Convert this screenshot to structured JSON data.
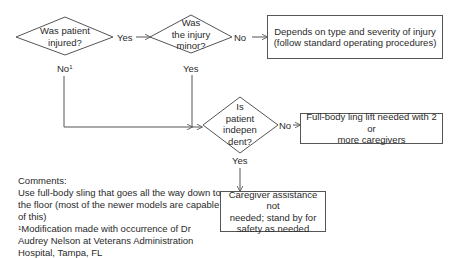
{
  "diagram": {
    "type": "flowchart",
    "decisions": [
      {
        "id": "d1",
        "lines": [
          "Was patient",
          "injured?"
        ]
      },
      {
        "id": "d2",
        "lines": [
          "Was",
          "the injury",
          "minor?"
        ]
      },
      {
        "id": "d3",
        "lines": [
          "Is",
          "patient",
          "indepen",
          "dent?"
        ]
      }
    ],
    "outcomes": [
      {
        "id": "o1",
        "lines": [
          "Depends on type and severity of injury",
          "(follow standard operating procedures)"
        ]
      },
      {
        "id": "o2",
        "lines": [
          "Full-body ling lift needed with 2 or",
          "more caregivers"
        ]
      },
      {
        "id": "o3",
        "lines": [
          "Caregiver assistance not",
          "needed; stand by for",
          "safety as needed"
        ]
      }
    ],
    "edges": [
      {
        "from": "d1",
        "to": "d2",
        "label": "Yes"
      },
      {
        "from": "d2",
        "to": "o1",
        "label": "No"
      },
      {
        "from": "d1",
        "to": "d3",
        "label": "No",
        "footnote_mark": "1"
      },
      {
        "from": "d2",
        "to": "d3",
        "label": "Yes"
      },
      {
        "from": "d3",
        "to": "o2",
        "label": "No"
      },
      {
        "from": "d3",
        "to": "o3",
        "label": "Yes"
      }
    ],
    "comments": {
      "heading": "Comments:",
      "lines": [
        "Use full-body sling that goes all the way down to",
        "the floor (most of the newer models are capable",
        "of this)"
      ],
      "footnote_mark": "1",
      "footnote_lines": [
        "Modification made with occurrence of Dr",
        "Audrey Nelson at Veterans Administration",
        "Hospital, Tampa, FL"
      ]
    },
    "colors": {
      "line": "#555555",
      "text": "#2a2a2a",
      "background": "#ffffff"
    }
  }
}
